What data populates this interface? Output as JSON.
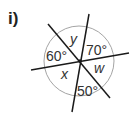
{
  "question_label": "i)",
  "diagram": {
    "angles": [
      {
        "id": "top-left-small",
        "label": "y",
        "type": "variable"
      },
      {
        "id": "top-right",
        "label": "70°",
        "type": "given"
      },
      {
        "id": "right",
        "label": "w",
        "type": "variable"
      },
      {
        "id": "bottom",
        "label": "50°",
        "type": "given"
      },
      {
        "id": "bottom-left",
        "label": "x",
        "type": "variable"
      },
      {
        "id": "left",
        "label": "60°",
        "type": "given"
      }
    ],
    "colors": {
      "lines": "#1a1a1a",
      "circle": "#9a9a9a",
      "text": "#333333"
    }
  }
}
